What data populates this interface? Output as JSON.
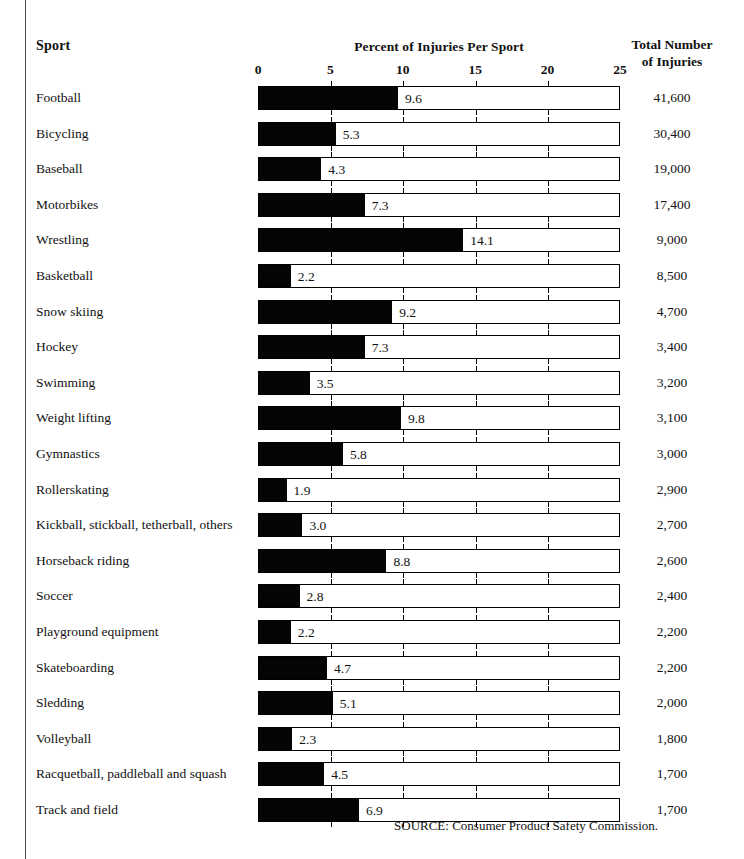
{
  "headers": {
    "sport": "Sport",
    "chart_title": "Percent of Injuries Per Sport",
    "total_line1": "Total Number",
    "total_line2": "of Injuries"
  },
  "source": "SOURCE: Consumer Product Safety Commission.",
  "colors": {
    "bar_fill": "#050505",
    "bar_outline": "#000000",
    "background": "#ffffff",
    "text": "#111111"
  },
  "chart_data": {
    "type": "bar",
    "title": "Percent of Injuries Per Sport",
    "xlabel": "",
    "ylabel": "Sport",
    "xlim": [
      0,
      25
    ],
    "xticks": [
      0,
      5,
      10,
      15,
      20,
      25
    ],
    "tick_labels": [
      "0",
      "5",
      "10",
      "15",
      "20",
      "25"
    ],
    "grid": false,
    "legend": false,
    "orientation": "horizontal",
    "value_label_format": "one-decimal",
    "extra_column": "Total Number of Injuries",
    "categories": [
      "Football",
      "Bicycling",
      "Baseball",
      "Motorbikes",
      "Wrestling",
      "Basketball",
      "Snow skiing",
      "Hockey",
      "Swimming",
      "Weight lifting",
      "Gymnastics",
      "Rollerskating",
      "Kickball, stickball, tetherball, others",
      "Horseback riding",
      "Soccer",
      "Playground equipment",
      "Skateboarding",
      "Sledding",
      "Volleyball",
      "Racquetball, paddleball and squash",
      "Track and field"
    ],
    "values": [
      9.6,
      5.3,
      4.3,
      7.3,
      14.1,
      2.2,
      9.2,
      7.3,
      3.5,
      9.8,
      5.8,
      1.9,
      3.0,
      8.8,
      2.8,
      2.2,
      4.7,
      5.1,
      2.3,
      4.5,
      6.9
    ],
    "value_labels": [
      "9.6",
      "5.3",
      "4.3",
      "7.3",
      "14.1",
      "2.2",
      "9.2",
      "7.3",
      "3.5",
      "9.8",
      "5.8",
      "1.9",
      "3.0",
      "8.8",
      "2.8",
      "2.2",
      "4.7",
      "5.1",
      "2.3",
      "4.5",
      "6.9"
    ],
    "totals": [
      41600,
      30400,
      19000,
      17400,
      9000,
      8500,
      4700,
      3400,
      3200,
      3100,
      3000,
      2900,
      2700,
      2600,
      2400,
      2200,
      2200,
      2000,
      1800,
      1700,
      1700
    ],
    "total_labels": [
      "41,600",
      "30,400",
      "19,000",
      "17,400",
      "9,000",
      "8,500",
      "4,700",
      "3,400",
      "3,200",
      "3,100",
      "3,000",
      "2,900",
      "2,700",
      "2,600",
      "2,400",
      "2,200",
      "2,200",
      "2,000",
      "1,800",
      "1,700",
      "1,700"
    ]
  }
}
